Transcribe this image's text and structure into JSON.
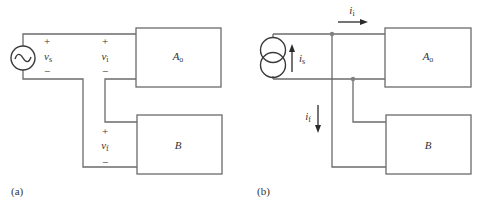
{
  "panels": [
    {
      "caption": "(a)",
      "source": {
        "type": "voltage",
        "symbol": "~",
        "label": "v",
        "label_sub": "s"
      },
      "blocks": [
        {
          "label": "A",
          "sub": "o"
        },
        {
          "label": "B",
          "sub": ""
        }
      ],
      "ports": [
        {
          "plus": "+",
          "minus": "−",
          "label": "v",
          "sub": "s"
        },
        {
          "plus": "+",
          "minus": "−",
          "label": "v",
          "sub": "i"
        },
        {
          "plus": "+",
          "minus": "−",
          "label": "v",
          "sub": "f"
        }
      ]
    },
    {
      "caption": "(b)",
      "source": {
        "type": "current",
        "label": "i",
        "label_sub": "s"
      },
      "blocks": [
        {
          "label": "A",
          "sub": "o"
        },
        {
          "label": "B",
          "sub": ""
        }
      ],
      "currents": [
        {
          "label": "i",
          "sub": "i",
          "direction": "right"
        },
        {
          "label": "i",
          "sub": "f",
          "direction": "down"
        },
        {
          "label": "i",
          "sub": "s",
          "direction": "up"
        }
      ]
    }
  ],
  "colors": {
    "wire": "#6b6b6b",
    "text": "#333333",
    "node": "#808080"
  }
}
